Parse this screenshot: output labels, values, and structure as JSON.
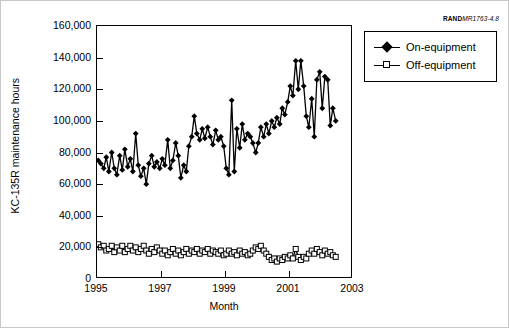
{
  "source_tag": {
    "brand": "RAND",
    "number": "MR1763-4.8"
  },
  "chart_data": {
    "type": "line",
    "title": "",
    "xlabel": "Month",
    "ylabel": "KC-135R maintenance hours",
    "xlim": [
      1995.0,
      2003.0
    ],
    "ylim": [
      0,
      160000
    ],
    "grid": false,
    "legend_position": "outside-right-top",
    "ytick_labels": [
      "160,000",
      "140,000",
      "120,000",
      "100,000",
      "80,000",
      "60,000",
      "40,000",
      "20,000",
      "0"
    ],
    "ytick_values": [
      160000,
      140000,
      120000,
      100000,
      80000,
      60000,
      40000,
      20000,
      0
    ],
    "xtick_labels": [
      "1995",
      "1997",
      "1999",
      "2001",
      "2003"
    ],
    "xtick_values": [
      1995,
      1997,
      1999,
      2001,
      2003
    ],
    "series": [
      {
        "name": "On-equipment",
        "marker": "filled-diamond",
        "color": "#000000",
        "x": [
          1995.04,
          1995.12,
          1995.21,
          1995.29,
          1995.37,
          1995.46,
          1995.54,
          1995.62,
          1995.71,
          1995.79,
          1995.87,
          1995.96,
          1996.04,
          1996.12,
          1996.21,
          1996.29,
          1996.37,
          1996.46,
          1996.54,
          1996.62,
          1996.71,
          1996.79,
          1996.87,
          1996.96,
          1997.04,
          1997.12,
          1997.21,
          1997.29,
          1997.37,
          1997.46,
          1997.54,
          1997.62,
          1997.71,
          1997.79,
          1997.87,
          1997.96,
          1998.04,
          1998.12,
          1998.21,
          1998.29,
          1998.37,
          1998.46,
          1998.54,
          1998.62,
          1998.71,
          1998.79,
          1998.87,
          1998.96,
          1999.04,
          1999.12,
          1999.21,
          1999.29,
          1999.37,
          1999.46,
          1999.54,
          1999.62,
          1999.71,
          1999.79,
          1999.87,
          1999.96,
          2000.04,
          2000.12,
          2000.21,
          2000.29,
          2000.37,
          2000.46,
          2000.54,
          2000.62,
          2000.71,
          2000.79,
          2000.87,
          2000.96,
          2001.04,
          2001.12,
          2001.21,
          2001.29,
          2001.37,
          2001.46,
          2001.54,
          2001.62,
          2001.71,
          2001.79,
          2001.87,
          2001.96,
          2002.04,
          2002.12,
          2002.21,
          2002.29,
          2002.37,
          2002.46
        ],
        "values": [
          75000,
          73000,
          70000,
          77000,
          68000,
          80000,
          70000,
          66000,
          78000,
          69000,
          82000,
          71000,
          76000,
          68000,
          92000,
          72000,
          65000,
          70000,
          60000,
          73000,
          78000,
          71000,
          74000,
          70000,
          76000,
          72000,
          88000,
          70000,
          75000,
          86000,
          78000,
          64000,
          72000,
          68000,
          84000,
          90000,
          103000,
          92000,
          88000,
          95000,
          89000,
          96000,
          90000,
          85000,
          94000,
          88000,
          90000,
          84000,
          70000,
          66000,
          113000,
          68000,
          95000,
          83000,
          98000,
          88000,
          92000,
          90000,
          86000,
          80000,
          86000,
          96000,
          90000,
          98000,
          92000,
          100000,
          96000,
          102000,
          98000,
          108000,
          104000,
          112000,
          122000,
          116000,
          138000,
          120000,
          138000,
          122000,
          103000,
          96000,
          114000,
          90000,
          126000,
          131000,
          108000,
          128000,
          126000,
          97000,
          108000,
          100000
        ],
        "approx_min": 60000,
        "approx_max": 138000
      },
      {
        "name": "Off-equipment",
        "marker": "open-square",
        "color": "#000000",
        "x": [
          1995.04,
          1995.12,
          1995.21,
          1995.29,
          1995.37,
          1995.46,
          1995.54,
          1995.62,
          1995.71,
          1995.79,
          1995.87,
          1995.96,
          1996.04,
          1996.12,
          1996.21,
          1996.29,
          1996.37,
          1996.46,
          1996.54,
          1996.62,
          1996.71,
          1996.79,
          1996.87,
          1996.96,
          1997.04,
          1997.12,
          1997.21,
          1997.29,
          1997.37,
          1997.46,
          1997.54,
          1997.62,
          1997.71,
          1997.79,
          1997.87,
          1997.96,
          1998.04,
          1998.12,
          1998.21,
          1998.29,
          1998.37,
          1998.46,
          1998.54,
          1998.62,
          1998.71,
          1998.79,
          1998.87,
          1998.96,
          1999.04,
          1999.12,
          1999.21,
          1999.29,
          1999.37,
          1999.46,
          1999.54,
          1999.62,
          1999.71,
          1999.79,
          1999.87,
          1999.96,
          2000.04,
          2000.12,
          2000.21,
          2000.29,
          2000.37,
          2000.46,
          2000.54,
          2000.62,
          2000.71,
          2000.79,
          2000.87,
          2000.96,
          2001.04,
          2001.12,
          2001.21,
          2001.29,
          2001.37,
          2001.46,
          2001.54,
          2001.62,
          2001.71,
          2001.79,
          2001.87,
          2001.96,
          2002.04,
          2002.12,
          2002.21,
          2002.29,
          2002.37,
          2002.46
        ],
        "values": [
          22000,
          20000,
          21000,
          18000,
          19000,
          21000,
          17000,
          20000,
          18000,
          21000,
          17000,
          19000,
          21000,
          18000,
          20000,
          17000,
          19000,
          21000,
          18000,
          16000,
          19000,
          17000,
          20000,
          18000,
          16000,
          18000,
          15000,
          17000,
          19000,
          16000,
          18000,
          15000,
          17000,
          19000,
          16000,
          18000,
          17000,
          19000,
          16000,
          18000,
          17000,
          19000,
          16000,
          18000,
          17000,
          16000,
          18000,
          15000,
          16000,
          18000,
          16000,
          17000,
          15000,
          18000,
          16000,
          17000,
          15000,
          16000,
          18000,
          20000,
          19000,
          21000,
          18000,
          16000,
          14000,
          12000,
          13000,
          11000,
          13000,
          12000,
          14000,
          13000,
          15000,
          13000,
          19000,
          14000,
          12000,
          14000,
          13000,
          16000,
          18000,
          16000,
          19000,
          17000,
          15000,
          18000,
          16000,
          17000,
          15000,
          14000
        ],
        "approx_min": 11000,
        "approx_max": 22000
      }
    ]
  },
  "legend": {
    "entries": [
      {
        "label": "On-equipment"
      },
      {
        "label": "Off-equipment"
      }
    ]
  }
}
